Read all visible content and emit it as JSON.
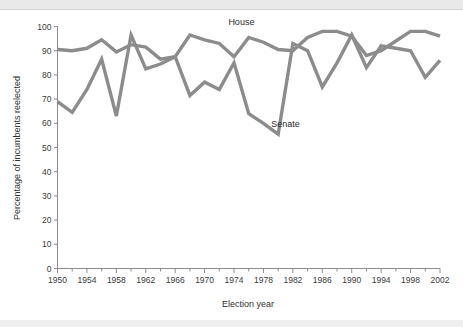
{
  "chart_data": {
    "type": "line",
    "title": "",
    "xlabel": "Election year",
    "ylabel": "Percentage of incumbents reelected",
    "xlim": [
      1950,
      2002
    ],
    "ylim": [
      0,
      100
    ],
    "grid": false,
    "legend_position": "inline-annotation",
    "x_major_tick_step": 4,
    "x_minor_tick_step": 2,
    "y_tick_step": 10,
    "x_tick_labels": [
      "1950",
      "1954",
      "1958",
      "1962",
      "1966",
      "1970",
      "1974",
      "1978",
      "1982",
      "1986",
      "1990",
      "1994",
      "1998",
      "2002"
    ],
    "y_tick_labels": [
      "0",
      "10",
      "20",
      "30",
      "40",
      "50",
      "60",
      "70",
      "80",
      "90",
      "100"
    ],
    "x": [
      1950,
      1952,
      1954,
      1956,
      1958,
      1960,
      1962,
      1964,
      1966,
      1968,
      1970,
      1972,
      1974,
      1976,
      1978,
      1980,
      1982,
      1984,
      1986,
      1988,
      1990,
      1992,
      1994,
      1996,
      1998,
      2000,
      2002
    ],
    "series": [
      {
        "name": "House",
        "color": "#8c8c8c",
        "values": [
          90.5,
          90,
          91,
          94.5,
          89.5,
          92.5,
          91.5,
          86.5,
          87.5,
          96.5,
          94.5,
          93,
          87.5,
          95.5,
          93.5,
          90.5,
          90,
          95.5,
          98,
          98,
          96,
          88,
          90,
          94,
          98,
          98,
          96
        ]
      },
      {
        "name": "Senate",
        "color": "#8c8c8c",
        "values": [
          69,
          64.5,
          74,
          86.5,
          63,
          96.5,
          82.5,
          84.5,
          87.5,
          71.5,
          77,
          74,
          85,
          64,
          60,
          55.5,
          93,
          90,
          75,
          85,
          96.5,
          83,
          92,
          91,
          90,
          79,
          86
        ]
      }
    ],
    "annotations": [
      {
        "name": "House",
        "label": "House",
        "x": 1975,
        "y": 100.5
      },
      {
        "name": "Senate",
        "label": "Senate",
        "x": 1981,
        "y": 58.5
      }
    ]
  },
  "colors": {
    "line": "#8c8c8c",
    "axis": "#8d8d8d",
    "text": "#2f2f2f",
    "band": "#e9e9e9",
    "background": "#ffffff"
  }
}
